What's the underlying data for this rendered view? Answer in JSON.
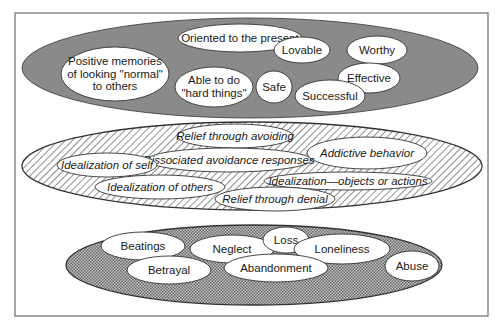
{
  "diagram": {
    "frame": {
      "x": 15,
      "y": 13,
      "w": 473,
      "h": 303,
      "stroke": "#6b6b6b"
    },
    "layers": [
      {
        "id": "top",
        "name": "positive-self-layer",
        "fill": "#8a8a8a",
        "pattern": "solid",
        "ellipse": {
          "cx": 250,
          "cy": 68,
          "rx": 228,
          "ry": 50
        },
        "items": [
          {
            "label": "Oriented to the present",
            "lines": [
              "Oriented to the present"
            ],
            "cx": 240,
            "cy": 38,
            "rx": 62,
            "ry": 14
          },
          {
            "label": "Lovable",
            "lines": [
              "Lovable"
            ],
            "cx": 302,
            "cy": 50,
            "rx": 28,
            "ry": 13
          },
          {
            "label": "Worthy",
            "lines": [
              "Worthy"
            ],
            "cx": 377,
            "cy": 50,
            "rx": 30,
            "ry": 14
          },
          {
            "label": "Positive memories of looking \"normal\" to others",
            "lines": [
              "Positive memories",
              "of looking \"normal\"",
              "to others"
            ],
            "cx": 115,
            "cy": 74,
            "rx": 54,
            "ry": 27
          },
          {
            "label": "Able to do \"hard things\"",
            "lines": [
              "Able to do",
              "\"hard things\""
            ],
            "cx": 214,
            "cy": 87,
            "rx": 39,
            "ry": 20
          },
          {
            "label": "Safe",
            "lines": [
              "Safe"
            ],
            "cx": 274,
            "cy": 87,
            "rx": 18,
            "ry": 16
          },
          {
            "label": "Effective",
            "lines": [
              "Effective"
            ],
            "cx": 369,
            "cy": 78,
            "rx": 31,
            "ry": 15
          },
          {
            "label": "Successful",
            "lines": [
              "Successful"
            ],
            "cx": 330,
            "cy": 96,
            "rx": 35,
            "ry": 16
          }
        ]
      },
      {
        "id": "middle",
        "name": "avoidance-layer",
        "fill": "#ffffff",
        "pattern": "diagonal-hatch",
        "ellipse": {
          "cx": 252,
          "cy": 166,
          "rx": 230,
          "ry": 44
        },
        "items": [
          {
            "label": "Relief through avoiding",
            "lines": [
              "Relief through avoiding"
            ],
            "cx": 235,
            "cy": 136,
            "rx": 58,
            "ry": 12,
            "italic": true
          },
          {
            "label": "Addictive behavior",
            "lines": [
              "Addictive behavior"
            ],
            "cx": 367,
            "cy": 153,
            "rx": 60,
            "ry": 16,
            "italic": true
          },
          {
            "label": "Dissociated avoidance responses",
            "lines": [
              "Dissociated avoidance responses"
            ],
            "cx": 229,
            "cy": 160,
            "rx": 82,
            "ry": 12,
            "italic": true
          },
          {
            "label": "Idealization of self",
            "lines": [
              "Idealization of self"
            ],
            "cx": 107,
            "cy": 165,
            "rx": 50,
            "ry": 12,
            "italic": true
          },
          {
            "label": "Idealization of others",
            "lines": [
              "Idealization of others"
            ],
            "cx": 160,
            "cy": 187,
            "rx": 65,
            "ry": 12,
            "italic": true
          },
          {
            "label": "Idealization—objects or actions",
            "lines": [
              "Idealization—objects or actions"
            ],
            "cx": 348,
            "cy": 181,
            "rx": 84,
            "ry": 9,
            "italic": true
          },
          {
            "label": "Relief through denial",
            "lines": [
              "Relief through denial"
            ],
            "cx": 275,
            "cy": 199,
            "rx": 60,
            "ry": 12,
            "italic": true
          }
        ]
      },
      {
        "id": "bottom",
        "name": "trauma-layer",
        "fill": "#b0b0b0",
        "pattern": "crosshatch",
        "ellipse": {
          "cx": 254,
          "cy": 265,
          "rx": 188,
          "ry": 40
        },
        "items": [
          {
            "label": "Beatings",
            "lines": [
              "Beatings"
            ],
            "cx": 143,
            "cy": 246,
            "rx": 42,
            "ry": 14
          },
          {
            "label": "Betrayal",
            "lines": [
              "Betrayal"
            ],
            "cx": 169,
            "cy": 270,
            "rx": 42,
            "ry": 14
          },
          {
            "label": "Neglect",
            "lines": [
              "Neglect"
            ],
            "cx": 232,
            "cy": 249,
            "rx": 42,
            "ry": 14
          },
          {
            "label": "Loss",
            "lines": [
              "Loss"
            ],
            "cx": 286,
            "cy": 240,
            "rx": 23,
            "ry": 13
          },
          {
            "label": "Loneliness",
            "lines": [
              "Loneliness"
            ],
            "cx": 342,
            "cy": 249,
            "rx": 48,
            "ry": 15
          },
          {
            "label": "Abandonment",
            "lines": [
              "Abandonment"
            ],
            "cx": 276,
            "cy": 268,
            "rx": 52,
            "ry": 14
          },
          {
            "label": "Abuse",
            "lines": [
              "Abuse"
            ],
            "cx": 412,
            "cy": 266,
            "rx": 27,
            "ry": 15
          }
        ]
      }
    ]
  }
}
